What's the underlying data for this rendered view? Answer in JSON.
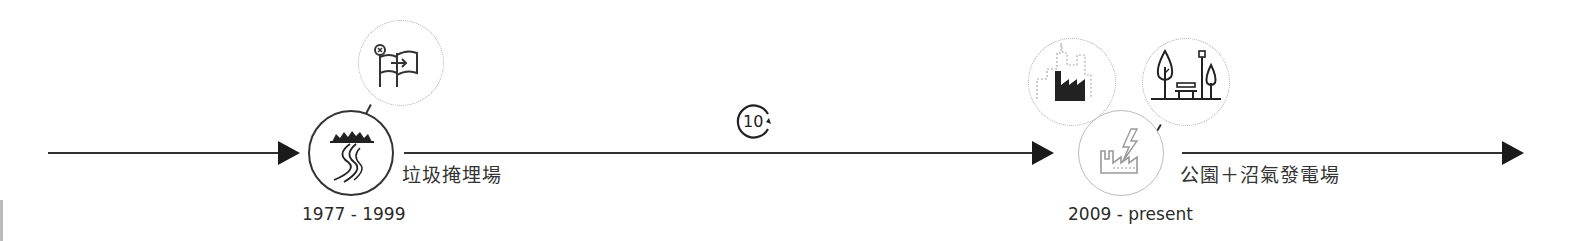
{
  "timeline": {
    "stages": [
      {
        "period": "1977 - 1999",
        "label": "垃圾掩埋場",
        "node_icon": "river-landfill-icon",
        "linked_icons": [
          "flag-relocation-icon"
        ]
      },
      {
        "period": "2009 - present",
        "label": "公園＋沼氣發電場",
        "node_icon": "factory-power-icon",
        "linked_icons": [
          "city-industry-icon",
          "park-icon"
        ]
      }
    ],
    "interval_badge": {
      "value": "10",
      "icon": "cycle-arrow-icon"
    }
  },
  "colors": {
    "line": "#333333",
    "arrow": "#1a1a1a",
    "node_border_active": "#333333",
    "node_border_present": "#bbbbbb",
    "dotted_border": "#aaaaaa"
  }
}
